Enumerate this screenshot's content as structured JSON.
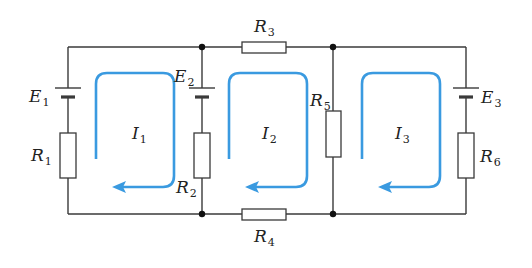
{
  "diagram": {
    "type": "circuit",
    "colors": {
      "wire": "#3a3a3a",
      "loop": "#3a9ae0",
      "background": "#ffffff"
    },
    "components": {
      "E1": {
        "name": "E",
        "sub": "1",
        "kind": "battery"
      },
      "E2": {
        "name": "E",
        "sub": "2",
        "kind": "battery"
      },
      "E3": {
        "name": "E",
        "sub": "3",
        "kind": "battery"
      },
      "R1": {
        "name": "R",
        "sub": "1",
        "kind": "resistor"
      },
      "R2": {
        "name": "R",
        "sub": "2",
        "kind": "resistor"
      },
      "R3": {
        "name": "R",
        "sub": "3",
        "kind": "resistor"
      },
      "R4": {
        "name": "R",
        "sub": "4",
        "kind": "resistor"
      },
      "R5": {
        "name": "R",
        "sub": "5",
        "kind": "resistor"
      },
      "R6": {
        "name": "R",
        "sub": "6",
        "kind": "resistor"
      }
    },
    "loops": {
      "I1": {
        "name": "I",
        "sub": "1",
        "direction": "clockwise"
      },
      "I2": {
        "name": "I",
        "sub": "2",
        "direction": "clockwise"
      },
      "I3": {
        "name": "I",
        "sub": "3",
        "direction": "clockwise"
      }
    },
    "nodes": 4
  }
}
